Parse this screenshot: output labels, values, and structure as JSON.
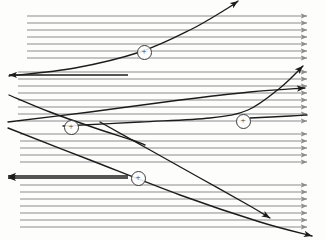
{
  "figure": {
    "kind": "flow-field-diagram",
    "canvas": {
      "width": 325,
      "height": 240,
      "background": "#fdfdfc"
    },
    "style": {
      "flow_line_color": "#8c8c8c",
      "flow_line_width": 1.05,
      "separatrix_color": "#1c1c1c",
      "separatrix_width": 1.35,
      "marker_color": "#3a3a3a",
      "marker_radius": 6.5
    },
    "markers": [
      {
        "id": "marker-1",
        "label": "+",
        "cx": 143,
        "cy": 51
      },
      {
        "id": "marker-2",
        "label": "+",
        "cx": 70,
        "cy": 126
      },
      {
        "id": "marker-3",
        "label": "+",
        "cx": 242,
        "cy": 120
      },
      {
        "id": "marker-4",
        "label": "+",
        "cx": 137,
        "cy": 177
      }
    ],
    "flow_bands": [
      {
        "id": "band-1",
        "direction": "right",
        "x_start": 27,
        "x_end": 307,
        "lines_y": [
          16,
          23,
          30,
          37,
          44,
          51,
          58
        ]
      },
      {
        "id": "band-2",
        "direction": "right",
        "x_start": 18,
        "x_end": 307,
        "lines_y": [
          72,
          79,
          86,
          93,
          100,
          107,
          114,
          121
        ]
      },
      {
        "id": "band-3",
        "direction": "right",
        "x_start": 20,
        "x_end": 307,
        "lines_y": [
          134,
          141,
          148,
          155,
          162
        ]
      },
      {
        "id": "band-4",
        "direction": "right",
        "x_start": 20,
        "x_end": 307,
        "lines_y": [
          185,
          192,
          199,
          206,
          213,
          220,
          227
        ]
      }
    ],
    "left_arrows": [
      {
        "id": "left-arrow-1",
        "y": 75,
        "x_from": 128,
        "x_to": 9
      },
      {
        "id": "left-arrow-2",
        "y": 176,
        "x_from": 128,
        "x_to": 8
      },
      {
        "id": "left-arrow-3",
        "y": 178,
        "x_from": 128,
        "x_to": 8
      }
    ],
    "separatrices": [
      {
        "id": "separatrix-1",
        "note": "rises from lower-left to upper-right, arrowhead top",
        "points": [
          [
            9,
            76
          ],
          [
            75,
            68
          ],
          [
            140,
            52
          ],
          [
            190,
            30
          ],
          [
            228,
            8
          ],
          [
            238,
            1
          ]
        ],
        "arrow_at": "end"
      },
      {
        "id": "separatrix-2",
        "note": "descends from upper-left to the plus at mid-left",
        "points": [
          [
            9,
            95
          ],
          [
            50,
            112
          ],
          [
            95,
            128
          ],
          [
            132,
            140
          ],
          [
            145,
            145
          ]
        ],
        "arrow_at": "none"
      },
      {
        "id": "separatrix-3",
        "note": "long flat curve running right, turns up to upper-right arrow",
        "points": [
          [
            63,
            126
          ],
          [
            140,
            122
          ],
          [
            210,
            118
          ],
          [
            248,
            110
          ],
          [
            280,
            88
          ],
          [
            303,
            66
          ]
        ],
        "arrow_at": "end"
      },
      {
        "id": "separatrix-4",
        "note": "shallow rise to right-edge arrow below the previous one",
        "points": [
          [
            8,
            122
          ],
          [
            90,
            112
          ],
          [
            180,
            100
          ],
          [
            250,
            92
          ],
          [
            305,
            88
          ]
        ],
        "arrow_at": "end"
      },
      {
        "id": "separatrix-5",
        "note": "falls from upper-middle down to lower-right arrow",
        "points": [
          [
            100,
            122
          ],
          [
            150,
            150
          ],
          [
            200,
            178
          ],
          [
            250,
            206
          ],
          [
            270,
            218
          ]
        ],
        "arrow_at": "end"
      },
      {
        "id": "separatrix-6",
        "note": "falls from mid-left across to far lower-right arrow",
        "points": [
          [
            8,
            128
          ],
          [
            90,
            160
          ],
          [
            180,
            195
          ],
          [
            260,
            222
          ],
          [
            312,
            236
          ]
        ],
        "arrow_at": "end"
      },
      {
        "id": "separatrix-7",
        "note": "flat segment running right from the mid plus marker toward edge",
        "points": [
          [
            250,
            118
          ],
          [
            290,
            116
          ],
          [
            307,
            115
          ]
        ],
        "arrow_at": "none"
      }
    ]
  }
}
